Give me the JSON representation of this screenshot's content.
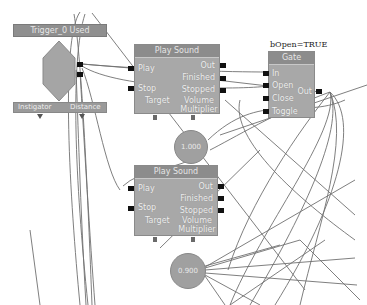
{
  "event": {
    "title": "Trigger_0 Used",
    "outputs": [
      "Used",
      "Unused"
    ],
    "variable_links": [
      "Instigator",
      "Distance"
    ]
  },
  "play_sound_1": {
    "title": "Play Sound",
    "inputs": [
      "Play",
      "Stop"
    ],
    "outputs": [
      "Out",
      "Finished",
      "Stopped"
    ],
    "variable_links": [
      "Target",
      "Volume Multiplier"
    ],
    "volume_value": "1.000"
  },
  "play_sound_2": {
    "title": "Play Sound",
    "inputs": [
      "Play",
      "Stop"
    ],
    "outputs": [
      "Out",
      "Finished",
      "Stopped"
    ],
    "variable_links": [
      "Target",
      "Volume Multiplier"
    ],
    "volume_value": "0.900"
  },
  "gate": {
    "comment": "bOpen=TRUE",
    "title": "Gate",
    "inputs": [
      "In",
      "Open",
      "Close",
      "Toggle"
    ],
    "outputs": [
      "Out"
    ]
  },
  "colors": {
    "node_body": "#a8a8a8",
    "node_title": "#8c8c8c",
    "wire": "#6e6e6e",
    "pin": "#111111"
  }
}
